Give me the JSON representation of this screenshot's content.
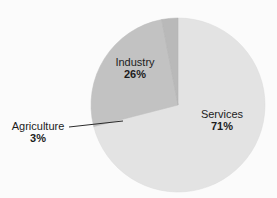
{
  "chart_data": {
    "type": "pie",
    "title": "",
    "subtitle": "",
    "xlabel": "",
    "ylabel": "",
    "legend_position": "none",
    "grid": false,
    "units": "percent",
    "start_angle_deg": 0,
    "direction": "clockwise",
    "categories": [
      "Services",
      "Industry",
      "Agriculture"
    ],
    "values": [
      71,
      26,
      3
    ],
    "slices": [
      {
        "label": "Services",
        "value": 71,
        "value_text": "71%",
        "color": "#e3e3e3",
        "label_placement": "inside",
        "leader_line": false
      },
      {
        "label": "Industry",
        "value": 26,
        "value_text": "26%",
        "color": "#c2c2c2",
        "label_placement": "inside",
        "leader_line": false
      },
      {
        "label": "Agriculture",
        "value": 3,
        "value_text": "3%",
        "color": "#b9b9b9",
        "label_placement": "outside-left",
        "leader_line": true
      }
    ],
    "annotations": [
      {
        "name": "agriculture-leader-line",
        "from_label": "Agriculture",
        "color": "#2b2b2b"
      }
    ]
  },
  "colors": {
    "background": "#fbfbfb",
    "services": "#e3e3e3",
    "industry": "#c2c2c2",
    "agriculture": "#b9b9b9",
    "pie_outline": "#d2d2d2",
    "text": "#1c1c1c",
    "leader_line": "#2b2b2b"
  },
  "geometry": {
    "center_x": 178,
    "center_y": 105,
    "radius": 87
  }
}
